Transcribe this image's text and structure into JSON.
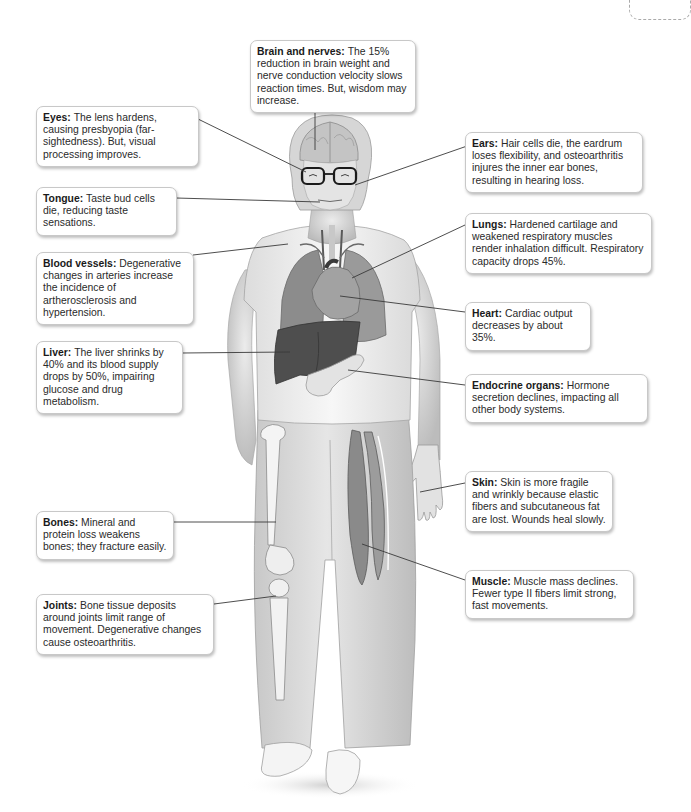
{
  "diagram": {
    "callouts": [
      {
        "id": "brain",
        "title": "Brain and nerves:",
        "text": "The 15% reduction in brain weight and nerve conduction velocity slows reaction times. But, wisdom may increase."
      },
      {
        "id": "eyes",
        "title": "Eyes:",
        "text": "The lens hardens, causing presbyopia (far-sightedness). But, visual processing improves."
      },
      {
        "id": "ears",
        "title": "Ears:",
        "text": "Hair cells die, the eardrum loses flexibility, and osteoarthritis injures the inner ear bones, resulting in hearing loss."
      },
      {
        "id": "tongue",
        "title": "Tongue:",
        "text": "Taste bud cells die, reducing taste sensations."
      },
      {
        "id": "lungs",
        "title": "Lungs:",
        "text": "Hardened cartilage and weakened respiratory muscles render inhalation difficult. Respiratory capacity drops 45%."
      },
      {
        "id": "blood-vessels",
        "title": "Blood vessels:",
        "text": "Degenerative changes in arteries increase the incidence of artherosclerosis and hypertension."
      },
      {
        "id": "heart",
        "title": "Heart:",
        "text": "Cardiac output decreases by about 35%."
      },
      {
        "id": "liver",
        "title": "Liver:",
        "text": "The liver shrinks by 40% and its blood supply drops by 50%, impairing glucose and drug metabolism."
      },
      {
        "id": "endocrine",
        "title": "Endocrine organs:",
        "text": "Hormone secretion declines, impacting all other body systems."
      },
      {
        "id": "skin",
        "title": "Skin:",
        "text": "Skin is more fragile and wrinkly because elastic fibers and subcutaneous fat are lost. Wounds heal slowly."
      },
      {
        "id": "bones",
        "title": "Bones:",
        "text": "Mineral and protein loss weakens bones; they fracture easily."
      },
      {
        "id": "muscle",
        "title": "Muscle:",
        "text": "Muscle mass declines. Fewer type II fibers limit strong, fast movements."
      },
      {
        "id": "joints",
        "title": "Joints:",
        "text": "Bone tissue deposits around joints limit range of movement. Degenerative changes cause osteoarthritis."
      }
    ]
  },
  "colors": {
    "callout_border": "#c8c8c8",
    "leader_line": "#3a3a3a",
    "figure_shirt": "#f2f2f2",
    "figure_pants": "#d9d9d9",
    "liver": "#555555",
    "lungs": "#8a8a8a",
    "heart": "#9a9a9a"
  }
}
